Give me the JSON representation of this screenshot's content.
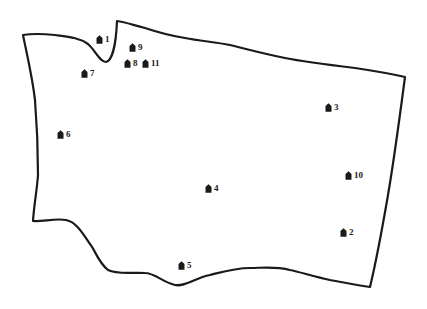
{
  "map": {
    "outline_color": "#1a1a1a",
    "background_color": "#ffffff",
    "markers": [
      {
        "id": 1,
        "label": "1",
        "icon": "house-icon",
        "x": 100,
        "y": 40
      },
      {
        "id": 2,
        "label": "2",
        "icon": "house-icon",
        "x": 344,
        "y": 233
      },
      {
        "id": 3,
        "label": "3",
        "icon": "house-icon",
        "x": 329,
        "y": 108
      },
      {
        "id": 4,
        "label": "4",
        "icon": "house-icon",
        "x": 209,
        "y": 189
      },
      {
        "id": 5,
        "label": "5",
        "icon": "house-icon",
        "x": 182,
        "y": 266
      },
      {
        "id": 6,
        "label": "6",
        "icon": "house-icon",
        "x": 61,
        "y": 135
      },
      {
        "id": 7,
        "label": "7",
        "icon": "house-icon",
        "x": 85,
        "y": 74
      },
      {
        "id": 8,
        "label": "8",
        "icon": "house-icon",
        "x": 128,
        "y": 64
      },
      {
        "id": 9,
        "label": "9",
        "icon": "house-icon",
        "x": 133,
        "y": 48
      },
      {
        "id": 10,
        "label": "10",
        "icon": "house-icon",
        "x": 349,
        "y": 176
      },
      {
        "id": 11,
        "label": "11",
        "icon": "house-icon",
        "x": 146,
        "y": 64
      }
    ]
  }
}
